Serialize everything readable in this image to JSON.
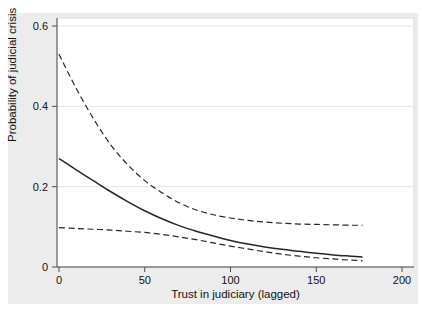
{
  "chart_data": {
    "type": "line",
    "title": "",
    "xlabel": "Trust in judiciary (lagged)",
    "ylabel": "Probability of judicial crisis",
    "xlim": [
      0,
      200
    ],
    "ylim": [
      0,
      0.62
    ],
    "xticks": [
      0,
      50,
      100,
      150,
      200
    ],
    "xtick_labels": [
      "0",
      "50",
      "100",
      "150",
      "200"
    ],
    "yticks": [
      0,
      0.2,
      0.4,
      0.6
    ],
    "ytick_labels": [
      "0",
      "0.2",
      "0.4",
      "0.6"
    ],
    "grid": "horizontal-only",
    "legend": "none",
    "colors": {
      "graph_region_bg": "#ececec",
      "plot_bg": "#ffffff",
      "gridline": "#e4e4e4",
      "plot_border": "#d9d9d9",
      "axis_line": "#4a4a4a",
      "line_color": "#262626",
      "text_color": "#111111"
    },
    "x": [
      0,
      10,
      20,
      30,
      40,
      50,
      60,
      70,
      80,
      90,
      100,
      110,
      120,
      130,
      140,
      150,
      160,
      170,
      177
    ],
    "series": [
      {
        "name": "upper-95-ci",
        "style": "dashed",
        "y": [
          0.53,
          0.445,
          0.37,
          0.305,
          0.255,
          0.215,
          0.185,
          0.16,
          0.142,
          0.13,
          0.122,
          0.116,
          0.112,
          0.109,
          0.107,
          0.106,
          0.105,
          0.104,
          0.104
        ]
      },
      {
        "name": "point-estimate",
        "style": "solid",
        "y": [
          0.27,
          0.242,
          0.215,
          0.188,
          0.163,
          0.14,
          0.12,
          0.103,
          0.089,
          0.077,
          0.066,
          0.057,
          0.05,
          0.044,
          0.039,
          0.034,
          0.03,
          0.027,
          0.025
        ]
      },
      {
        "name": "lower-95-ci",
        "style": "dashed",
        "y": [
          0.098,
          0.096,
          0.094,
          0.092,
          0.089,
          0.086,
          0.081,
          0.075,
          0.068,
          0.06,
          0.052,
          0.045,
          0.038,
          0.032,
          0.027,
          0.023,
          0.02,
          0.017,
          0.016
        ]
      }
    ]
  }
}
